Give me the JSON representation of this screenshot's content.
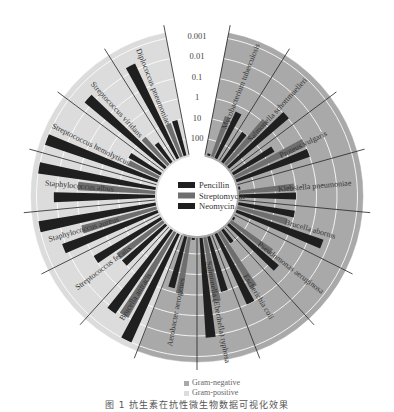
{
  "chart_data": {
    "type": "radial-bar",
    "title": "",
    "scale": "log (MIC, reversed: 100 at inner ring, 0.001 at outer ring)",
    "ring_labels": [
      "0.001",
      "0.01",
      "0.1",
      "1",
      "10",
      "100"
    ],
    "ring_values": [
      0.001,
      0.01,
      0.1,
      1,
      10,
      100
    ],
    "legend": [
      {
        "name": "Pencillin",
        "color": "#1f1f1f"
      },
      {
        "name": "Streptomycin",
        "color": "#6e6e6e"
      },
      {
        "name": "Neomycin",
        "color": "#1f1f1f"
      }
    ],
    "gram_legend": [
      {
        "name": "Gram-negative",
        "color": "#a9a9a9"
      },
      {
        "name": "Gram-positive",
        "color": "#dcdcdc"
      }
    ],
    "categories": [
      "Mycobacterium tuberculosis",
      "Salmonella schottmuelleri",
      "Proteus vulgaris",
      "Klebsiella pneumoniae",
      "Brucella abortus",
      "Pseudomonas aeruginosa",
      "Escherichia coli",
      "Salmonella (Eberthella) typhosa",
      "Aerobacter aerogenes",
      "Brucella antracis",
      "Streptococcus fecalis",
      "Staphylococcus aureus",
      "Staphylococcus albus",
      "Streptococcus hemolyticus",
      "Streptococcus viridans",
      "Diplococcus pneumoniae"
    ],
    "gram": [
      "negative",
      "negative",
      "negative",
      "negative",
      "negative",
      "negative",
      "negative",
      "negative",
      "negative",
      "positive",
      "positive",
      "positive",
      "positive",
      "positive",
      "positive",
      "positive"
    ],
    "series": [
      {
        "name": "Pencillin",
        "values": [
          800,
          10,
          3,
          850,
          1,
          850,
          100,
          1,
          870,
          0.001,
          1,
          0.007,
          0.007,
          0.001,
          0.005,
          0.005
        ]
      },
      {
        "name": "Streptomycin",
        "values": [
          5,
          0.8,
          0.1,
          1.2,
          2,
          2,
          0.4,
          0.4,
          1,
          0.01,
          1,
          0.1,
          0.1,
          14,
          10,
          11
        ]
      },
      {
        "name": "Neomycin",
        "values": [
          2,
          0.09,
          0.1,
          1,
          0.02,
          0.4,
          0.1,
          0.008,
          1.6,
          0.007,
          0.1,
          0.001,
          0.001,
          10,
          40,
          10
        ]
      }
    ]
  },
  "center_legend": {
    "items": [
      "Pencillin",
      "Streptomycin",
      "Neomycin"
    ]
  },
  "bottom_legend": {
    "negative": "Gram-negative",
    "positive": "Gram-positive"
  },
  "caption": "图 1  抗生素在抗性微生物数据可视化效果"
}
